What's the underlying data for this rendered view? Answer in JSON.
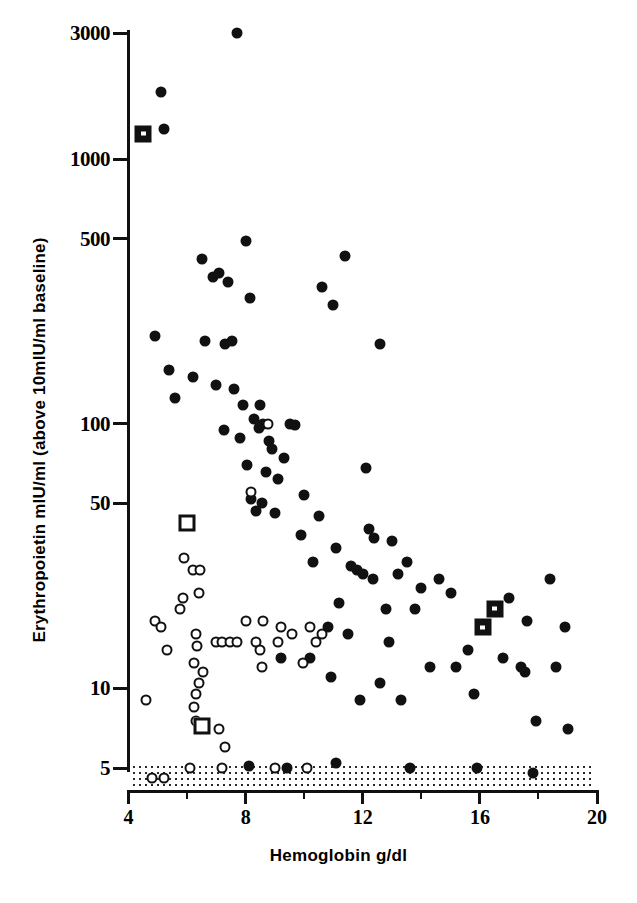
{
  "figure": {
    "x_title": "Hemoglobin g/dl",
    "y_title": "Erythropoietin mIU/ml (above 10mIU/ml baseline)"
  },
  "chart_data": {
    "type": "scatter",
    "title": "",
    "xlabel": "Hemoglobin g/dl",
    "ylabel": "Erythropoietin mIU/ml (above 10mIU/ml baseline)",
    "xlim": [
      4,
      20
    ],
    "ylim": [
      5,
      3000
    ],
    "yscale": "log",
    "xscale": "linear",
    "grid": false,
    "legend_position": "none",
    "xticks": [
      4,
      8,
      12,
      16,
      20
    ],
    "xticklabels": [
      "4",
      "8",
      "12",
      "16",
      "20"
    ],
    "x_minor_ticks": [
      6,
      10,
      14,
      18
    ],
    "yticks": [
      5,
      10,
      50,
      100,
      500,
      1000,
      3000
    ],
    "yticklabels": [
      "5",
      "10",
      "50",
      "100",
      "500",
      "1000",
      "3000"
    ],
    "annotations": [
      {
        "name": "detection-limit-band",
        "text": "",
        "y_value": 5,
        "description": "stippled band at baseline indicating values at or below 5 mIU/ml"
      }
    ],
    "series": [
      {
        "name": "filled-circle",
        "marker": "filled circle",
        "color": "#111111",
        "points": [
          [
            7.7,
            3000
          ],
          [
            5.1,
            1800
          ],
          [
            5.2,
            1300
          ],
          [
            6.5,
            420
          ],
          [
            7.4,
            345
          ],
          [
            8.0,
            490
          ],
          [
            8.15,
            300
          ],
          [
            7.1,
            370
          ],
          [
            6.9,
            360
          ],
          [
            10.6,
            330
          ],
          [
            11.4,
            430
          ],
          [
            11.0,
            280
          ],
          [
            4.9,
            215
          ],
          [
            5.4,
            160
          ],
          [
            6.6,
            205
          ],
          [
            7.3,
            200
          ],
          [
            7.55,
            205
          ],
          [
            12.6,
            200
          ],
          [
            6.2,
            150
          ],
          [
            7.0,
            140
          ],
          [
            7.6,
            135
          ],
          [
            5.6,
            125
          ],
          [
            7.9,
            118
          ],
          [
            8.5,
            118
          ],
          [
            8.3,
            104
          ],
          [
            8.6,
            100
          ],
          [
            8.45,
            96
          ],
          [
            7.25,
            95
          ],
          [
            9.5,
            100
          ],
          [
            9.7,
            99
          ],
          [
            7.8,
            88
          ],
          [
            8.8,
            86
          ],
          [
            8.9,
            80
          ],
          [
            9.3,
            74
          ],
          [
            8.05,
            70
          ],
          [
            8.7,
            66
          ],
          [
            9.1,
            62
          ],
          [
            12.1,
            68
          ],
          [
            10.0,
            54
          ],
          [
            8.2,
            52
          ],
          [
            8.55,
            50
          ],
          [
            8.35,
            47
          ],
          [
            9.0,
            46
          ],
          [
            10.5,
            45
          ],
          [
            9.9,
            38
          ],
          [
            11.1,
            34
          ],
          [
            12.2,
            40
          ],
          [
            12.4,
            37
          ],
          [
            13.0,
            36
          ],
          [
            10.3,
            30
          ],
          [
            11.6,
            29
          ],
          [
            11.8,
            28
          ],
          [
            12.0,
            27
          ],
          [
            12.35,
            26
          ],
          [
            13.2,
            27
          ],
          [
            13.5,
            30
          ],
          [
            14.0,
            24
          ],
          [
            14.6,
            26
          ],
          [
            15.0,
            23
          ],
          [
            16.1,
            17
          ],
          [
            16.5,
            20
          ],
          [
            17.0,
            22
          ],
          [
            17.6,
            18
          ],
          [
            18.4,
            26
          ],
          [
            18.9,
            17
          ],
          [
            15.6,
            14
          ],
          [
            17.4,
            12
          ],
          [
            17.55,
            11.5
          ],
          [
            18.6,
            12
          ],
          [
            12.8,
            20
          ],
          [
            11.2,
            21
          ],
          [
            13.8,
            20
          ],
          [
            10.8,
            17
          ],
          [
            11.5,
            16
          ],
          [
            12.9,
            15
          ],
          [
            10.2,
            13
          ],
          [
            14.3,
            12
          ],
          [
            16.8,
            13
          ],
          [
            15.2,
            12
          ],
          [
            9.2,
            13
          ],
          [
            11.9,
            9
          ],
          [
            13.3,
            9
          ],
          [
            17.9,
            7.5
          ],
          [
            19.0,
            7
          ],
          [
            15.8,
            9.5
          ],
          [
            12.6,
            10.5
          ],
          [
            10.9,
            11
          ],
          [
            13.6,
            5
          ],
          [
            15.9,
            5
          ],
          [
            17.8,
            4.8
          ],
          [
            9.4,
            5
          ],
          [
            11.1,
            5.2
          ],
          [
            8.1,
            5.1
          ]
        ]
      },
      {
        "name": "open-circle",
        "marker": "open circle",
        "color": "#111111",
        "points": [
          [
            8.75,
            100
          ],
          [
            8.2,
            55
          ],
          [
            5.9,
            31
          ],
          [
            6.2,
            28
          ],
          [
            6.45,
            28
          ],
          [
            6.4,
            23
          ],
          [
            5.85,
            22
          ],
          [
            5.75,
            20
          ],
          [
            4.9,
            18
          ],
          [
            5.1,
            17
          ],
          [
            8.0,
            18
          ],
          [
            8.6,
            18
          ],
          [
            9.2,
            17
          ],
          [
            9.6,
            16
          ],
          [
            10.2,
            17
          ],
          [
            10.6,
            16
          ],
          [
            10.4,
            15
          ],
          [
            9.1,
            15
          ],
          [
            6.3,
            16
          ],
          [
            6.35,
            14.5
          ],
          [
            7.0,
            15
          ],
          [
            7.2,
            15
          ],
          [
            7.45,
            15
          ],
          [
            7.7,
            15
          ],
          [
            8.35,
            15
          ],
          [
            8.5,
            14
          ],
          [
            5.3,
            14
          ],
          [
            6.25,
            12.5
          ],
          [
            6.55,
            11.5
          ],
          [
            6.4,
            10.5
          ],
          [
            4.6,
            9
          ],
          [
            6.3,
            9.5
          ],
          [
            6.25,
            8.5
          ],
          [
            6.3,
            7.5
          ],
          [
            7.1,
            7
          ],
          [
            7.3,
            6
          ],
          [
            7.2,
            5
          ],
          [
            4.8,
            4.6
          ],
          [
            5.2,
            4.6
          ],
          [
            6.1,
            5
          ],
          [
            9.0,
            5
          ],
          [
            10.1,
            5
          ],
          [
            8.55,
            12
          ],
          [
            9.95,
            12.5
          ]
        ]
      },
      {
        "name": "filled-square",
        "marker": "filled square",
        "color": "#111111",
        "points": [
          [
            4.5,
            1250
          ],
          [
            16.1,
            17
          ],
          [
            16.5,
            20
          ]
        ]
      },
      {
        "name": "open-square",
        "marker": "open square",
        "color": "#111111",
        "points": [
          [
            6.0,
            42
          ],
          [
            6.5,
            7.2
          ]
        ]
      }
    ]
  }
}
